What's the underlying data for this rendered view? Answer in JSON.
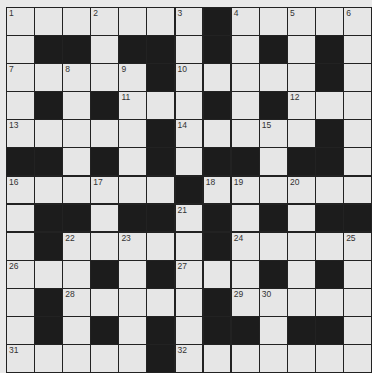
{
  "puzzle": {
    "rows": 13,
    "cols": 13,
    "grid": [
      "WWWWWWWBWWWWW",
      "WBBWBBWBWBWBW",
      "WWWWWBWWWWWBW",
      "WBWBWWWBWBWWW",
      "WWWWWBWWWWWBW",
      "BBWBWBWBBWBBW",
      "WWWWWWBWWWWWW",
      "WBBWBBWBWBWBB",
      "WBWWWWWBWWWWW",
      "WWWBWBWWWBWBW",
      "WBWWWWWBWWWWW",
      "WBWBWBWBBWBBW",
      "WWWWWBWWWWWWW"
    ],
    "numbers": [
      {
        "r": 0,
        "c": 0,
        "n": "1"
      },
      {
        "r": 0,
        "c": 3,
        "n": "2"
      },
      {
        "r": 0,
        "c": 6,
        "n": "3"
      },
      {
        "r": 0,
        "c": 8,
        "n": "4"
      },
      {
        "r": 0,
        "c": 10,
        "n": "5"
      },
      {
        "r": 0,
        "c": 12,
        "n": "6"
      },
      {
        "r": 2,
        "c": 0,
        "n": "7"
      },
      {
        "r": 2,
        "c": 2,
        "n": "8"
      },
      {
        "r": 2,
        "c": 4,
        "n": "9"
      },
      {
        "r": 2,
        "c": 6,
        "n": "10"
      },
      {
        "r": 3,
        "c": 4,
        "n": "11"
      },
      {
        "r": 3,
        "c": 10,
        "n": "12"
      },
      {
        "r": 4,
        "c": 0,
        "n": "13"
      },
      {
        "r": 4,
        "c": 6,
        "n": "14"
      },
      {
        "r": 4,
        "c": 9,
        "n": "15"
      },
      {
        "r": 6,
        "c": 0,
        "n": "16"
      },
      {
        "r": 6,
        "c": 3,
        "n": "17"
      },
      {
        "r": 6,
        "c": 7,
        "n": "18"
      },
      {
        "r": 6,
        "c": 8,
        "n": "19"
      },
      {
        "r": 6,
        "c": 10,
        "n": "20"
      },
      {
        "r": 7,
        "c": 6,
        "n": "21"
      },
      {
        "r": 8,
        "c": 2,
        "n": "22"
      },
      {
        "r": 8,
        "c": 4,
        "n": "23"
      },
      {
        "r": 8,
        "c": 8,
        "n": "24"
      },
      {
        "r": 8,
        "c": 12,
        "n": "25"
      },
      {
        "r": 9,
        "c": 0,
        "n": "26"
      },
      {
        "r": 9,
        "c": 6,
        "n": "27"
      },
      {
        "r": 10,
        "c": 2,
        "n": "28"
      },
      {
        "r": 10,
        "c": 8,
        "n": "29"
      },
      {
        "r": 10,
        "c": 9,
        "n": "30"
      },
      {
        "r": 12,
        "c": 0,
        "n": "31"
      },
      {
        "r": 12,
        "c": 6,
        "n": "32"
      }
    ]
  }
}
